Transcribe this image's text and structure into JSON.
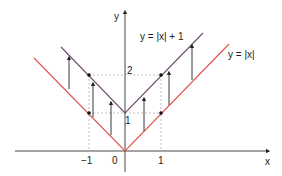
{
  "diagram": {
    "axes": {
      "x_label": "x",
      "y_label": "y"
    },
    "ticks": {
      "x": [
        "−1",
        "0",
        "1"
      ],
      "y": [
        "1",
        "2"
      ]
    },
    "curves": [
      {
        "label": "y = |x|",
        "color": "#e0504a"
      },
      {
        "label": "y = |x| + 1",
        "color": "#6e4a6e"
      }
    ],
    "arrows_count": 7,
    "marked_points": [
      "(-1,1)",
      "(-1,2)",
      "(1,1)",
      "(1,2)"
    ]
  }
}
